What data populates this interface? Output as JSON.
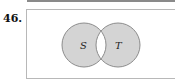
{
  "problem_number": "46.",
  "diagram": {
    "type": "venn",
    "sets": [
      {
        "label": "S"
      },
      {
        "label": "T"
      }
    ],
    "shaded_regions": [
      "S only",
      "T only"
    ],
    "unshaded_regions": [
      "S ∩ T",
      "outside"
    ],
    "colors": {
      "shade": "#d4d4d4",
      "outline": "#8c8c8c",
      "box_border": "#b8b8b8"
    }
  }
}
